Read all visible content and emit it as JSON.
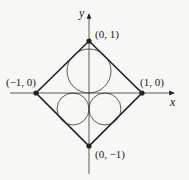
{
  "diagram": {
    "axes": {
      "x_label": "x",
      "y_label": "y"
    },
    "vertices": [
      {
        "label": "(0, 1)"
      },
      {
        "label": "(1, 0)"
      },
      {
        "label": "(0, −1)"
      },
      {
        "label": "(−1, 0)"
      }
    ],
    "shapes": {
      "square": "diamond with vertices (0,1), (1,0), (0,-1), (-1,0)",
      "circles": [
        "large circle in upper half",
        "small circle lower-left",
        "small circle lower-right"
      ]
    },
    "colors": {
      "stroke": "#222222",
      "background": "#f7f7f5"
    }
  }
}
